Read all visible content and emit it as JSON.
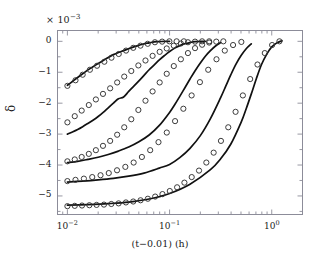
{
  "chart_data": {
    "type": "line",
    "title": "",
    "xlabel": "(t−0.01) (h)",
    "ylabel": "δ",
    "xscale": "log",
    "yscale": "linear",
    "y_exponent_label": "× 10",
    "y_exponent_sup": "−3",
    "y_multiplier": 0.001,
    "xlim": [
      0.008,
      2.0
    ],
    "ylim": [
      -5.6,
      0.35
    ],
    "xticks": [
      0.01,
      0.1,
      1
    ],
    "xticklabels": [
      "10",
      "10",
      "10"
    ],
    "xtick_sups": [
      "−2",
      "−1",
      "0"
    ],
    "yticks": [
      0,
      -1,
      -2,
      -3,
      -4,
      -5
    ],
    "yticklabels": [
      "0",
      "−1",
      "−2",
      "−3",
      "−4",
      "−5"
    ],
    "grid": false,
    "legend": false,
    "minor_ticks": true,
    "tick_direction": "in",
    "line_color": "#111111",
    "marker_color": "#333333",
    "marker_style": "open-circle",
    "axes_color": "#8c8c99",
    "background": "#ffffff",
    "series": [
      {
        "name": "curve-1-line",
        "kind": "line",
        "x": [
          0.01,
          0.0112,
          0.0126,
          0.0141,
          0.0158,
          0.0178,
          0.02,
          0.0224,
          0.0251,
          0.0282,
          0.0316,
          0.0355,
          0.0398,
          0.0447,
          0.0501,
          0.0562,
          0.0631,
          0.0708,
          0.0794,
          0.0891,
          0.1
        ],
        "y": [
          -1.42,
          -1.3,
          -1.17,
          -1.05,
          -0.93,
          -0.82,
          -0.72,
          -0.62,
          -0.52,
          -0.43,
          -0.36,
          -0.3,
          -0.24,
          -0.18,
          -0.13,
          -0.08,
          -0.05,
          -0.02,
          -0.01,
          0.0,
          0.0
        ]
      },
      {
        "name": "curve-1-markers",
        "kind": "markers",
        "x": [
          0.01,
          0.012,
          0.0141,
          0.0166,
          0.0195,
          0.023,
          0.027,
          0.0318,
          0.0375,
          0.0441,
          0.0519,
          0.0611,
          0.0719,
          0.0846,
          0.0996,
          0.1172,
          0.138
        ],
        "y": [
          -1.44,
          -1.26,
          -1.08,
          -0.92,
          -0.79,
          -0.66,
          -0.53,
          -0.41,
          -0.3,
          -0.21,
          -0.14,
          -0.08,
          -0.03,
          -0.01,
          0.0,
          0.0,
          0.0
        ]
      },
      {
        "name": "curve-2-line",
        "kind": "line",
        "x": [
          0.01,
          0.0112,
          0.0126,
          0.0141,
          0.0158,
          0.0178,
          0.02,
          0.0224,
          0.0251,
          0.0282,
          0.0316,
          0.0355,
          0.0398,
          0.0447,
          0.0501,
          0.0562,
          0.0631,
          0.0708,
          0.0794,
          0.0891,
          0.1,
          0.1122,
          0.1259,
          0.1413,
          0.1585,
          0.1778,
          0.2,
          0.2239
        ],
        "y": [
          -3.0,
          -2.93,
          -2.85,
          -2.76,
          -2.66,
          -2.55,
          -2.43,
          -2.3,
          -2.15,
          -2.0,
          -1.86,
          -1.8,
          -1.62,
          -1.45,
          -1.28,
          -1.1,
          -0.92,
          -0.76,
          -0.6,
          -0.46,
          -0.33,
          -0.22,
          -0.14,
          -0.08,
          -0.04,
          -0.01,
          0.0,
          0.0
        ]
      },
      {
        "name": "curve-2-markers",
        "kind": "markers",
        "x": [
          0.01,
          0.0118,
          0.0138,
          0.0162,
          0.019,
          0.0223,
          0.0262,
          0.0307,
          0.036,
          0.0422,
          0.0495,
          0.0581,
          0.0682,
          0.08,
          0.0938,
          0.11,
          0.129,
          0.1513,
          0.1775,
          0.2082,
          0.2442
        ],
        "y": [
          -2.62,
          -2.42,
          -2.24,
          -2.06,
          -1.88,
          -1.7,
          -1.52,
          -1.33,
          -1.14,
          -0.96,
          -0.78,
          -0.62,
          -0.47,
          -0.34,
          -0.23,
          -0.14,
          -0.07,
          -0.03,
          -0.01,
          0.0,
          0.0
        ]
      },
      {
        "name": "curve-3-line",
        "kind": "line",
        "x": [
          0.01,
          0.0126,
          0.0158,
          0.02,
          0.0251,
          0.0316,
          0.0398,
          0.0501,
          0.0631,
          0.0794,
          0.1,
          0.1122,
          0.1259,
          0.1413,
          0.1585,
          0.1778,
          0.2,
          0.2239,
          0.2512,
          0.2818,
          0.3162
        ],
        "y": [
          -3.92,
          -3.88,
          -3.82,
          -3.75,
          -3.66,
          -3.55,
          -3.42,
          -3.25,
          -3.03,
          -2.72,
          -2.3,
          -2.05,
          -1.78,
          -1.5,
          -1.22,
          -0.95,
          -0.7,
          -0.48,
          -0.3,
          -0.15,
          -0.04
        ]
      },
      {
        "name": "curve-3-markers",
        "kind": "markers",
        "x": [
          0.01,
          0.0118,
          0.0138,
          0.0162,
          0.019,
          0.0223,
          0.0262,
          0.0307,
          0.036,
          0.0422,
          0.0495,
          0.0581,
          0.0682,
          0.08,
          0.0938,
          0.11,
          0.129,
          0.1513,
          0.1775,
          0.2082,
          0.2442,
          0.2865,
          0.336
        ],
        "y": [
          -3.88,
          -3.82,
          -3.74,
          -3.64,
          -3.52,
          -3.38,
          -3.22,
          -3.02,
          -2.78,
          -2.52,
          -2.22,
          -1.92,
          -1.62,
          -1.33,
          -1.05,
          -0.8,
          -0.58,
          -0.38,
          -0.22,
          -0.11,
          -0.04,
          -0.01,
          0.0
        ]
      },
      {
        "name": "curve-4-line",
        "kind": "line",
        "x": [
          0.01,
          0.0141,
          0.02,
          0.0282,
          0.0398,
          0.0562,
          0.0794,
          0.1,
          0.1259,
          0.1585,
          0.2,
          0.2512,
          0.3162,
          0.3548,
          0.3981,
          0.4467,
          0.5012,
          0.5623,
          0.631
        ],
        "y": [
          -4.55,
          -4.52,
          -4.48,
          -4.43,
          -4.36,
          -4.26,
          -4.1,
          -3.98,
          -3.76,
          -3.46,
          -3.05,
          -2.5,
          -1.82,
          -1.45,
          -1.08,
          -0.74,
          -0.46,
          -0.24,
          -0.08
        ]
      },
      {
        "name": "curve-4-markers",
        "kind": "markers",
        "x": [
          0.01,
          0.012,
          0.0145,
          0.0175,
          0.0211,
          0.0254,
          0.0306,
          0.0369,
          0.0445,
          0.0536,
          0.0646,
          0.0779,
          0.0939,
          0.1132,
          0.1364,
          0.1644,
          0.1982,
          0.2389,
          0.2879,
          0.347,
          0.4182,
          0.5041
        ],
        "y": [
          -4.52,
          -4.48,
          -4.44,
          -4.39,
          -4.33,
          -4.26,
          -4.17,
          -4.06,
          -3.92,
          -3.74,
          -3.52,
          -3.26,
          -2.95,
          -2.58,
          -2.18,
          -1.75,
          -1.32,
          -0.92,
          -0.58,
          -0.3,
          -0.12,
          -0.02
        ]
      },
      {
        "name": "curve-5-line",
        "kind": "line",
        "x": [
          0.01,
          0.0158,
          0.0251,
          0.0398,
          0.0631,
          0.1,
          0.1585,
          0.2512,
          0.3162,
          0.3981,
          0.5012,
          0.5623,
          0.631,
          0.7079,
          0.7943,
          0.8913,
          1.0,
          1.122,
          1.2589
        ],
        "y": [
          -5.3,
          -5.28,
          -5.25,
          -5.2,
          -5.1,
          -4.92,
          -4.62,
          -4.15,
          -3.8,
          -3.32,
          -2.62,
          -2.18,
          -1.7,
          -1.2,
          -0.75,
          -0.42,
          -0.18,
          -0.05,
          0.02
        ]
      },
      {
        "name": "curve-5-markers",
        "kind": "markers",
        "x": [
          0.01,
          0.0118,
          0.0139,
          0.0164,
          0.0193,
          0.0228,
          0.0269,
          0.0317,
          0.0374,
          0.0441,
          0.052,
          0.0613,
          0.0723,
          0.0852,
          0.1005,
          0.1185,
          0.1397,
          0.1647,
          0.1942,
          0.229,
          0.27,
          0.3183,
          0.3753,
          0.4425,
          0.5217,
          0.6151,
          0.7252,
          0.8551,
          1.0082,
          1.1887
        ],
        "y": [
          -5.33,
          -5.32,
          -5.31,
          -5.3,
          -5.29,
          -5.28,
          -5.26,
          -5.24,
          -5.21,
          -5.18,
          -5.14,
          -5.09,
          -5.02,
          -4.94,
          -4.84,
          -4.72,
          -4.57,
          -4.39,
          -4.18,
          -3.92,
          -3.6,
          -3.22,
          -2.78,
          -2.28,
          -1.75,
          -1.22,
          -0.75,
          -0.38,
          -0.12,
          0.0
        ]
      }
    ]
  }
}
